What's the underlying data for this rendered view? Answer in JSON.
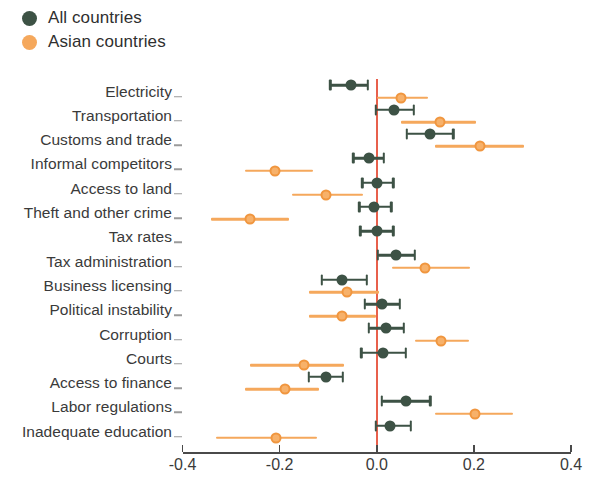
{
  "legend": {
    "items": [
      {
        "label": "All countries",
        "color": "#3d5245",
        "key": "all"
      },
      {
        "label": "Asian countries",
        "color": "#f5a85c",
        "key": "asian"
      }
    ]
  },
  "axis": {
    "tick_labels": [
      "-0.4",
      "-0.2",
      "0.0",
      "0.2",
      "0.4"
    ],
    "tick_values": [
      -0.4,
      -0.2,
      0.0,
      0.2,
      0.4
    ],
    "zero_line_color": "#e8604c"
  },
  "chart_data": {
    "type": "scatter",
    "title": "",
    "subtitle": "",
    "xlabel": "",
    "ylabel": "",
    "xlim": [
      -0.4,
      0.4
    ],
    "xticks": [
      -0.4,
      -0.2,
      0.0,
      0.2,
      0.4
    ],
    "xticklabels": [
      "-0.4",
      "-0.2",
      "0.0",
      "0.2",
      "0.4"
    ],
    "grid": false,
    "legend_position": "top-left",
    "orientation": "horizontal-dot-with-error-bars",
    "reference_line": 0.0,
    "categories": [
      "Electricity",
      "Transportation",
      "Customs and trade",
      "Informal competitors",
      "Access to land",
      "Theft and other crime",
      "Tax rates",
      "Tax administration",
      "Business licensing",
      "Political instability",
      "Corruption",
      "Courts",
      "Access to finance",
      "Labor regulations",
      "Inadequate education"
    ],
    "series": [
      {
        "name": "All countries",
        "color": "#3d5245",
        "values": [
          -0.052,
          0.035,
          0.11,
          -0.016,
          0.0,
          -0.006,
          0.0,
          0.04,
          -0.072,
          0.01,
          0.02,
          0.013,
          -0.105,
          0.06,
          0.028
        ],
        "ci_low": [
          -0.096,
          -0.002,
          0.062,
          -0.048,
          -0.03,
          -0.036,
          -0.034,
          0.002,
          -0.113,
          -0.025,
          -0.016,
          -0.032,
          -0.14,
          0.01,
          -0.002
        ],
        "ci_high": [
          -0.018,
          0.076,
          0.158,
          0.014,
          0.034,
          0.03,
          0.034,
          0.078,
          -0.02,
          0.048,
          0.056,
          0.06,
          -0.07,
          0.11,
          0.07
        ]
      },
      {
        "name": "Asian countries",
        "color": "#f5a85c",
        "values": [
          0.05,
          0.13,
          0.212,
          -0.21,
          -0.104,
          -0.262,
          null,
          0.1,
          -0.062,
          -0.072,
          0.132,
          -0.15,
          -0.188,
          0.202,
          -0.208
        ],
        "ci_low": [
          0.0,
          0.05,
          0.12,
          -0.272,
          -0.174,
          -0.342,
          null,
          0.032,
          -0.14,
          -0.14,
          0.078,
          -0.26,
          -0.272,
          0.12,
          -0.332
        ],
        "ci_high": [
          0.106,
          0.204,
          0.304,
          -0.132,
          -0.028,
          -0.18,
          null,
          0.192,
          0.004,
          -0.002,
          0.19,
          -0.068,
          -0.118,
          0.28,
          -0.122
        ]
      }
    ]
  }
}
